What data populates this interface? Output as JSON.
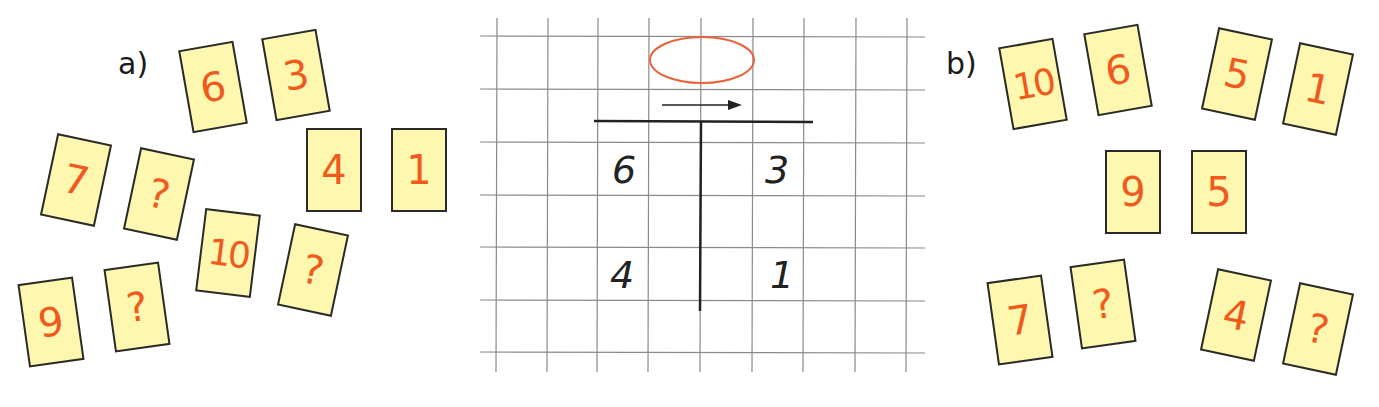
{
  "exercise_a": {
    "label": "a)",
    "cards": [
      {
        "value": "6",
        "x": 185,
        "y": 45,
        "rot": -10
      },
      {
        "value": "3",
        "x": 268,
        "y": 33,
        "rot": -10
      },
      {
        "value": "4",
        "x": 306,
        "y": 128,
        "rot": 0
      },
      {
        "value": "1",
        "x": 391,
        "y": 128,
        "rot": 0
      },
      {
        "value": "7",
        "x": 48,
        "y": 138,
        "rot": 12
      },
      {
        "value": "?",
        "x": 131,
        "y": 152,
        "rot": 12
      },
      {
        "value": "10",
        "x": 200,
        "y": 211,
        "rot": 7
      },
      {
        "value": "?",
        "x": 285,
        "y": 228,
        "rot": 12
      },
      {
        "value": "9",
        "x": 23,
        "y": 280,
        "rot": -8
      },
      {
        "value": "?",
        "x": 109,
        "y": 265,
        "rot": -8
      }
    ]
  },
  "exercise_b": {
    "label": "b)",
    "cards": [
      {
        "value": "10",
        "x": 1005,
        "y": 42,
        "rot": -10
      },
      {
        "value": "6",
        "x": 1090,
        "y": 28,
        "rot": -10
      },
      {
        "value": "5",
        "x": 1209,
        "y": 32,
        "rot": 12
      },
      {
        "value": "1",
        "x": 1290,
        "y": 47,
        "rot": 12
      },
      {
        "value": "9",
        "x": 1105,
        "y": 150,
        "rot": 0
      },
      {
        "value": "5",
        "x": 1191,
        "y": 150,
        "rot": 0
      },
      {
        "value": "7",
        "x": 992,
        "y": 278,
        "rot": -8
      },
      {
        "value": "?",
        "x": 1075,
        "y": 262,
        "rot": -8
      },
      {
        "value": "4",
        "x": 1208,
        "y": 273,
        "rot": 12
      },
      {
        "value": "?",
        "x": 1290,
        "y": 287,
        "rot": 12
      }
    ]
  },
  "t_chart": {
    "oval_answer": "",
    "rows": [
      {
        "left": "6",
        "right": "3"
      },
      {
        "left": "4",
        "right": "1"
      }
    ]
  },
  "colors": {
    "card_fill": "#fdf7b0",
    "card_number": "#f05a1c",
    "oval": "#e8643a",
    "grid": "#8a8a8a"
  }
}
